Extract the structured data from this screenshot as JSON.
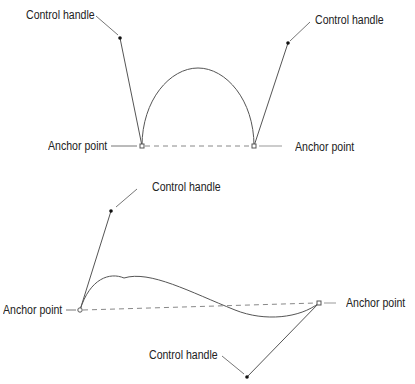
{
  "diagram": {
    "top": {
      "labels": {
        "control_left": "Control handle",
        "control_right": "Control handle",
        "anchor_left": "Anchor point",
        "anchor_right": "Anchor point"
      }
    },
    "bottom": {
      "labels": {
        "control_top": "Control handle",
        "control_bottom": "Control handle",
        "anchor_left": "Anchor point",
        "anchor_right": "Anchor point"
      }
    },
    "colors": {
      "line": "#555555",
      "text": "#222222"
    }
  }
}
